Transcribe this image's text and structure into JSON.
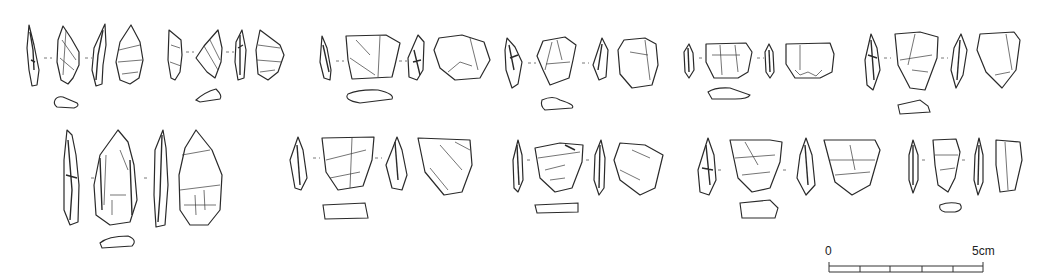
{
  "figure": {
    "type": "lithic artefact illustration plate",
    "ink_color": "#2a2a2a",
    "background": "#ffffff",
    "rows": [
      {
        "row": 1,
        "artefacts": [
          {
            "id": "a1",
            "views": 4,
            "shape": "pointed blade",
            "cx": 85
          },
          {
            "id": "a2",
            "views": 4,
            "shape": "pointed flake",
            "cx": 225
          },
          {
            "id": "a3",
            "views": 4,
            "shape": "quadrangular flake",
            "cx": 405
          },
          {
            "id": "a4",
            "views": 4,
            "shape": "rounded flake",
            "cx": 575
          },
          {
            "id": "a5",
            "views": 4,
            "shape": "wide flake",
            "cx": 755
          },
          {
            "id": "a6",
            "views": 4,
            "shape": "triangular flake",
            "cx": 945
          }
        ]
      },
      {
        "row": 2,
        "artefacts": [
          {
            "id": "b1",
            "views": 4,
            "shape": "elongated biface-like point",
            "cx": 130
          },
          {
            "id": "b2",
            "views": 4,
            "shape": "quadrangular flake",
            "cx": 365
          },
          {
            "id": "b3",
            "views": 4,
            "shape": "trapezoidal flake",
            "cx": 585
          },
          {
            "id": "b4",
            "views": 4,
            "shape": "triangular flake",
            "cx": 790
          },
          {
            "id": "b5",
            "views": 4,
            "shape": "narrow flake",
            "cx": 965
          }
        ]
      }
    ]
  },
  "scale_bar": {
    "start_label": "0",
    "end_label": "5cm",
    "segments": 5
  }
}
